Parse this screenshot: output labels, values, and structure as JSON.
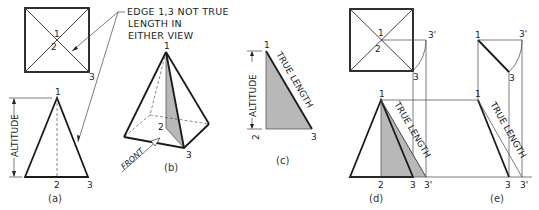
{
  "figure": {
    "note": [
      "EDGE 1,3 NOT TRUE",
      "LENGTH IN",
      "EITHER VIEW"
    ],
    "points": {
      "p1": "1",
      "p2": "2",
      "p3": "3",
      "p3prime": "3'"
    },
    "labels": {
      "altitude": "ALTITUDE",
      "true_length": "TRUE LENGTH",
      "front": "FRONT"
    },
    "captions": {
      "a": "(a)",
      "b": "(b)",
      "c": "(c)",
      "d": "(d)",
      "e": "(e)"
    },
    "colors": {
      "line": "#1a1a1a",
      "shade": "#b8b8b8",
      "background": "#ffffff"
    }
  }
}
